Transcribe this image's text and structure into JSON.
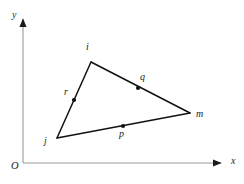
{
  "figure": {
    "background_color": "#ffffff",
    "line_color": "#111111",
    "axis_color": "#9a9a9a",
    "label_color": "#1a1a1a",
    "width": 244,
    "height": 184
  },
  "axes": {
    "origin": {
      "label": "O",
      "x": 11,
      "y": 162
    },
    "x_axis": {
      "label": "x",
      "label_x": 231,
      "label_y": 157,
      "start_x": 23,
      "start_y": 163,
      "end_x": 222,
      "end_y": 163,
      "arrow": "right-arrow-icon"
    },
    "y_axis": {
      "label": "y",
      "label_x": 12,
      "label_y": 10,
      "start_x": 23,
      "start_y": 163,
      "end_x": 23,
      "end_y": 18,
      "arrow": "up-arrow-icon"
    }
  },
  "triangle": {
    "vertices": [
      {
        "name": "i",
        "x": 91,
        "y": 62,
        "label_x": 86,
        "label_y": 43
      },
      {
        "name": "m",
        "x": 190,
        "y": 113,
        "label_x": 196,
        "label_y": 110
      },
      {
        "name": "j",
        "x": 57,
        "y": 138,
        "label_x": 44,
        "label_y": 138
      }
    ],
    "edges": [
      {
        "name": "edge-i-m",
        "from": "i",
        "to": "m"
      },
      {
        "name": "edge-m-j",
        "from": "m",
        "to": "j"
      },
      {
        "name": "edge-j-i",
        "from": "j",
        "to": "i"
      }
    ]
  },
  "midpoints": [
    {
      "name": "q",
      "x": 138,
      "y": 88,
      "label_x": 140,
      "label_y": 74,
      "on_edge": "edge-i-m"
    },
    {
      "name": "p",
      "x": 123,
      "y": 126,
      "label_x": 119,
      "label_y": 130,
      "on_edge": "edge-m-j"
    },
    {
      "name": "r",
      "x": 74,
      "y": 100,
      "label_x": 64,
      "label_y": 88,
      "on_edge": "edge-j-i"
    }
  ]
}
